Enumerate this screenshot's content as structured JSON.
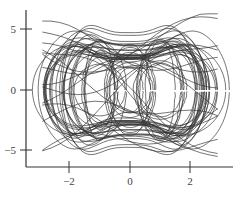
{
  "chart_data": {
    "type": "line",
    "title": "",
    "xlabel": "",
    "ylabel": "",
    "xlim": [
      -3.4,
      3.4
    ],
    "ylim": [
      -6.4,
      6.4
    ],
    "grid": false,
    "legend": null,
    "x_ticks": [
      {
        "value": -2,
        "label": "−2"
      },
      {
        "value": 0,
        "label": "0"
      },
      {
        "value": 2,
        "label": "2"
      }
    ],
    "y_ticks": [
      {
        "value": 5,
        "label": "5"
      },
      {
        "value": 0,
        "label": "0"
      },
      {
        "value": -5,
        "label": "−5"
      }
    ],
    "series": [
      {
        "name": "phase-portrait trajectory",
        "description": "chaotic double-lobed attractor; x in approx [-3.3, 3.3], y in approx [-6.3, 6.3]; nested loops around centers near x=-1, x=0, x=+1",
        "color": "#333333",
        "x_range": [
          -3.3,
          3.3
        ],
        "y_range": [
          -6.3,
          6.3
        ],
        "loop_centers_x": [
          -1.0,
          0.0,
          1.0
        ]
      }
    ],
    "style": {
      "line_color": "#333333",
      "axis_color": "#333333",
      "background": "#ffffff"
    }
  }
}
